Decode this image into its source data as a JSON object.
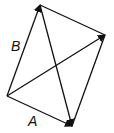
{
  "diagram": {
    "type": "vector-parallelogram",
    "labels": {
      "a": "A",
      "b": "B"
    },
    "points": {
      "origin": [
        7,
        96
      ],
      "a_tip": [
        72,
        126
      ],
      "b_tip": [
        40,
        5
      ],
      "sum_tip": [
        105,
        35
      ]
    },
    "stroke_color": "#111111"
  }
}
